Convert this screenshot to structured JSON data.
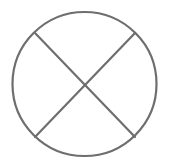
{
  "figure": {
    "shape": "circle-with-x",
    "icon": "crossed-circle-icon",
    "stroke_color": "#6e6e6e",
    "background_color": "#ffffff",
    "stroke_width": 2.2,
    "circle": {
      "cx": 84.5,
      "cy": 84,
      "r": 72
    },
    "lines": [
      {
        "name": "diagonal-down",
        "x1": 35,
        "y1": 33,
        "x2": 135,
        "y2": 137
      },
      {
        "name": "diagonal-up",
        "x1": 135,
        "y1": 33,
        "x2": 35,
        "y2": 137
      }
    ]
  }
}
